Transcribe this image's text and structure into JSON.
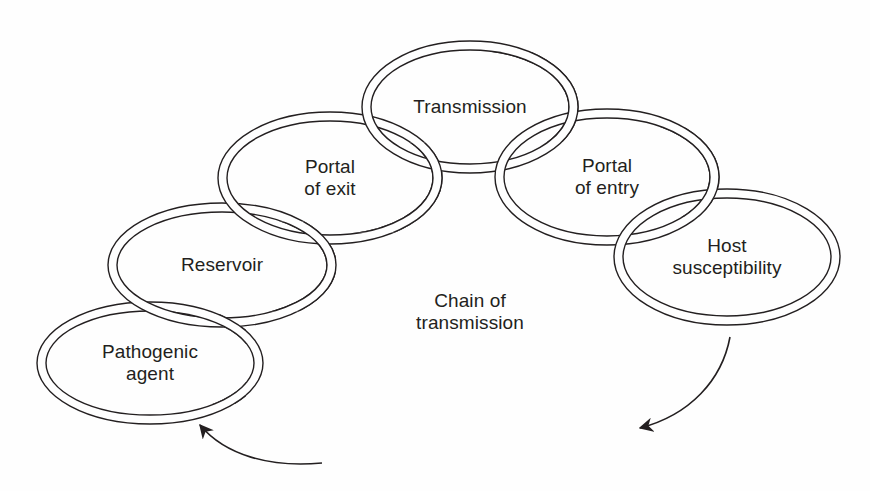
{
  "diagram": {
    "title": "Chain of transmission",
    "stroke_color": "#231f20",
    "background": "#fefefe",
    "rings": [
      {
        "id": "pathogenic-agent",
        "label": "Pathogenic\nagent",
        "cx": 150,
        "cy": 363,
        "rx": 113,
        "ry": 61
      },
      {
        "id": "reservoir",
        "label": "Reservoir",
        "cx": 222,
        "cy": 265,
        "rx": 114,
        "ry": 62
      },
      {
        "id": "portal-of-exit",
        "label": "Portal\nof exit",
        "cx": 330,
        "cy": 178,
        "rx": 112,
        "ry": 66
      },
      {
        "id": "transmission",
        "label": "Transmission",
        "cx": 470,
        "cy": 107,
        "rx": 108,
        "ry": 66
      },
      {
        "id": "portal-of-entry",
        "label": "Portal\nof entry",
        "cx": 607,
        "cy": 177,
        "rx": 112,
        "ry": 68
      },
      {
        "id": "host-susceptibility",
        "label": "Host\nsusceptibility",
        "cx": 727,
        "cy": 257,
        "rx": 113,
        "ry": 68
      }
    ],
    "center_label": "Chain of\ntransmission",
    "arrows": [
      {
        "id": "arrow-host-to-center",
        "description": "curved arrow from Host susceptibility down-left"
      },
      {
        "id": "arrow-to-pathogenic-agent",
        "description": "curved arrow pointing up-left to Pathogenic agent"
      }
    ]
  }
}
